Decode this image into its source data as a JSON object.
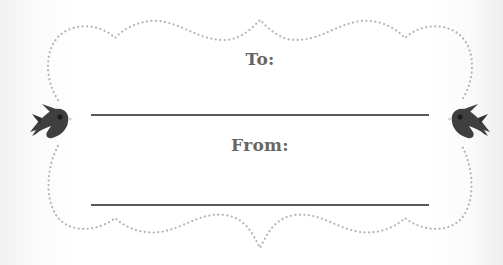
{
  "card": {
    "to_label": "To:",
    "from_label": "From:"
  },
  "decorations": {
    "border_style": "dotted-scalloped",
    "border_color": "#b5b5b5",
    "line_color": "#5a5a5a",
    "text_color": "#666666",
    "bird_color": "#3f3f3f",
    "icons": [
      "bird-icon-left",
      "bird-icon-right"
    ]
  }
}
